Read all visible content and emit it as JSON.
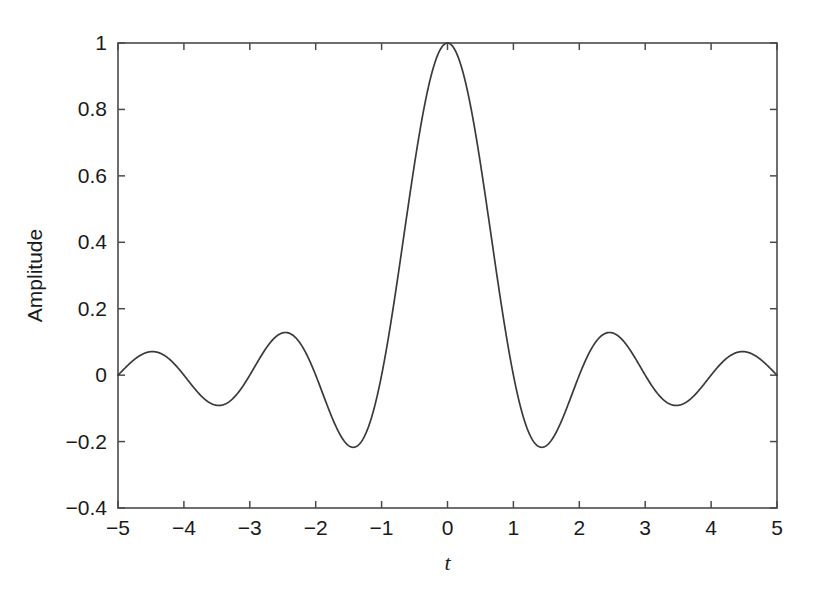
{
  "chart_data": {
    "type": "line",
    "title": "",
    "subtitle": "",
    "xlabel": "t",
    "ylabel": "Amplitude",
    "xlim": [
      -5,
      5
    ],
    "ylim": [
      -0.4,
      1
    ],
    "grid": false,
    "legend": null,
    "x_ticks": [
      -5,
      -4,
      -3,
      -2,
      -1,
      0,
      1,
      2,
      3,
      4,
      5
    ],
    "x_tick_labels": [
      "−5",
      "−4",
      "−3",
      "−2",
      "−1",
      "0",
      "1",
      "2",
      "3",
      "4",
      "5"
    ],
    "y_ticks": [
      -0.4,
      -0.2,
      0,
      0.2,
      0.4,
      0.6,
      0.8,
      1
    ],
    "y_tick_labels": [
      "−0.4",
      "−0.2",
      "0",
      "0.2",
      "0.4",
      "0.6",
      "0.8",
      "1"
    ],
    "line_color": "#3a3a3a",
    "axis_color": "#4a4a4a",
    "background_color": "#ffffff",
    "series": [
      {
        "name": "sinc",
        "formula": "sin(pi*t)/(pi*t)",
        "x": [
          -5,
          -4.9,
          -4.8,
          -4.7,
          -4.6,
          -4.5,
          -4.4,
          -4.3,
          -4.2,
          -4.1,
          -4,
          -3.9,
          -3.8,
          -3.7,
          -3.6,
          -3.5,
          -3.4,
          -3.3,
          -3.2,
          -3.1,
          -3,
          -2.9,
          -2.8,
          -2.7,
          -2.6,
          -2.5,
          -2.4,
          -2.3,
          -2.2,
          -2.1,
          -2,
          -1.9,
          -1.8,
          -1.7,
          -1.6,
          -1.5,
          -1.4,
          -1.3,
          -1.2,
          -1.1,
          -1,
          -0.9,
          -0.8,
          -0.7,
          -0.6,
          -0.5,
          -0.4,
          -0.3,
          -0.2,
          -0.1,
          0,
          0.1,
          0.2,
          0.3,
          0.4,
          0.5,
          0.6,
          0.7,
          0.8,
          0.9,
          1,
          1.1,
          1.2,
          1.3,
          1.4,
          1.5,
          1.6,
          1.7,
          1.8,
          1.9,
          2,
          2.1,
          2.2,
          2.3,
          2.4,
          2.5,
          2.6,
          2.7,
          2.8,
          2.9,
          3,
          3.1,
          3.2,
          3.3,
          3.4,
          3.5,
          3.6,
          3.7,
          3.8,
          3.9,
          4,
          4.1,
          4.2,
          4.3,
          4.4,
          4.5,
          4.6,
          4.7,
          4.8,
          4.9,
          5
        ],
        "y": [
          0,
          0.0202,
          0.0386,
          0.0532,
          0.0626,
          0.0637,
          0.0578,
          0.0449,
          0.0263,
          0.0045,
          0,
          -0.0247,
          -0.0487,
          -0.0691,
          -0.083,
          -0.0909,
          -0.0886,
          -0.0779,
          -0.06,
          -0.0365,
          0,
          0.0328,
          0.0663,
          0.0963,
          0.1185,
          0.1273,
          0.1258,
          0.1127,
          0.0894,
          0.0566,
          0,
          -0.0496,
          -0.1033,
          -0.1549,
          -0.1965,
          -0.2122,
          -0.2162,
          -0.1981,
          -0.1595,
          -0.1039,
          0,
          0.1093,
          0.2339,
          0.3678,
          0.5046,
          0.6366,
          0.7568,
          0.8584,
          0.9355,
          0.9836,
          1,
          0.9836,
          0.9355,
          0.8584,
          0.7568,
          0.6366,
          0.5046,
          0.3678,
          0.2339,
          0.1093,
          0,
          -0.1039,
          -0.1595,
          -0.1981,
          -0.2162,
          -0.2122,
          -0.1965,
          -0.1549,
          -0.1033,
          -0.0496,
          0,
          0.0566,
          0.0894,
          0.1127,
          0.1258,
          0.1273,
          0.1185,
          0.0963,
          0.0663,
          0.0328,
          0,
          -0.0365,
          -0.06,
          -0.0779,
          -0.0886,
          -0.0909,
          -0.083,
          -0.0691,
          -0.0487,
          -0.0247,
          0,
          0.0045,
          0.0263,
          0.0449,
          0.0578,
          0.0637,
          0.0626,
          0.0532,
          0.0386,
          0.0202,
          0
        ]
      }
    ],
    "annotations": []
  }
}
